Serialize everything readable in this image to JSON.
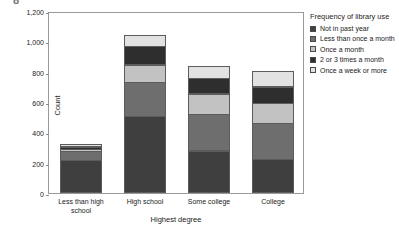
{
  "figure": {
    "top_glyph": "8"
  },
  "chart_data": {
    "type": "bar",
    "stacked": true,
    "title": "",
    "xlabel": "Highest degree",
    "ylabel": "Count",
    "ylim": [
      0,
      1200
    ],
    "yticks": [
      0,
      200,
      400,
      600,
      800,
      1000,
      1200
    ],
    "ytick_labels": [
      "0",
      "200",
      "400",
      "600",
      "800",
      "1,000",
      "1,200"
    ],
    "grid": false,
    "legend_position": "right",
    "legend_title": "Frequency of library use",
    "categories": [
      "Less than high school",
      "High school",
      "Some college",
      "College"
    ],
    "category_label_lines": [
      [
        "Less than high",
        "school"
      ],
      [
        "High school"
      ],
      [
        "Some college"
      ],
      [
        "College"
      ]
    ],
    "series": [
      {
        "name": "Not in past year",
        "color": "#3f3f3f",
        "values": [
          215,
          505,
          280,
          225
        ]
      },
      {
        "name": "Less than once a month",
        "color": "#6e6e6e",
        "values": [
          65,
          230,
          245,
          240
        ]
      },
      {
        "name": "Once a month",
        "color": "#c2c2c2",
        "values": [
          20,
          120,
          140,
          135
        ]
      },
      {
        "name": "2 or 3 times a month",
        "color": "#2e2e2e",
        "values": [
          20,
          125,
          105,
          115
        ]
      },
      {
        "name": "Once a week or more",
        "color": "#e2e2e2",
        "values": [
          20,
          80,
          85,
          105
        ]
      }
    ],
    "totals": [
      340,
      1060,
      855,
      820
    ]
  }
}
